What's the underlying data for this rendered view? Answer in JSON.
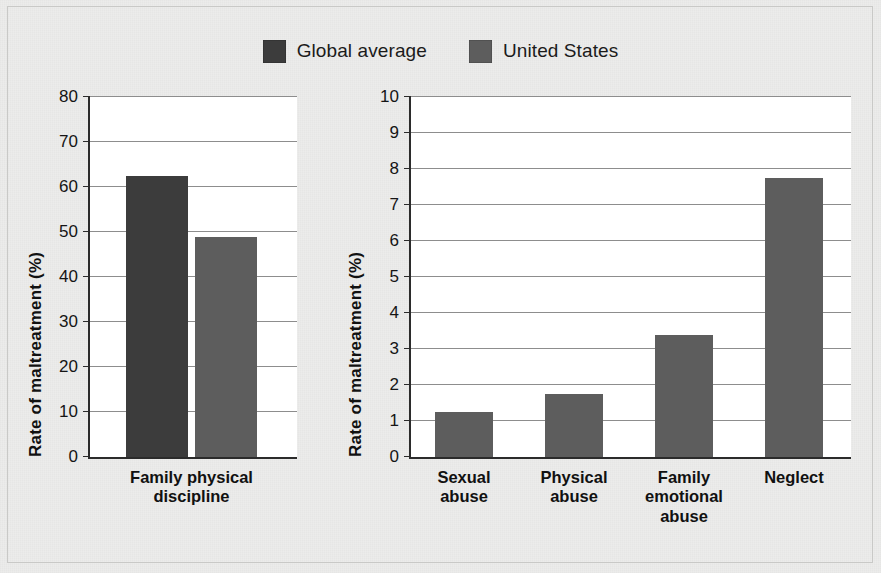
{
  "legend": {
    "items": [
      {
        "label": "Global average",
        "color": "#3c3c3c",
        "icon": "legend-swatch-icon"
      },
      {
        "label": "United States",
        "color": "#5d5d5d",
        "icon": "legend-swatch-icon"
      }
    ]
  },
  "chart_data": [
    {
      "type": "bar",
      "panel": "left",
      "title": "",
      "xlabel": "",
      "ylabel": "Rate of maltreatment (%)",
      "categories": [
        "Family physical\ndiscipline"
      ],
      "ylim": [
        0,
        80
      ],
      "ytick_step": 10,
      "yticks": [
        "0",
        "10",
        "20",
        "30",
        "40",
        "50",
        "60",
        "70",
        "80"
      ],
      "grid": true,
      "legend_position": "top-center",
      "series": [
        {
          "name": "Global average",
          "color": "#3c3c3c",
          "values": [
            62.5
          ]
        },
        {
          "name": "United States",
          "color": "#5d5d5d",
          "values": [
            48.8
          ]
        }
      ]
    },
    {
      "type": "bar",
      "panel": "right",
      "title": "",
      "xlabel": "",
      "ylabel": "Rate of maltreatment (%)",
      "categories": [
        "Sexual\nabuse",
        "Physical\nabuse",
        "Family\nemotional\nabuse",
        "Neglect"
      ],
      "ylim": [
        0,
        10
      ],
      "ytick_step": 1,
      "yticks": [
        "0",
        "1",
        "2",
        "3",
        "4",
        "5",
        "6",
        "7",
        "8",
        "9",
        "10"
      ],
      "grid": true,
      "legend_position": "top-center",
      "series": [
        {
          "name": "United States",
          "color": "#5d5d5d",
          "values": [
            1.25,
            1.75,
            3.4,
            7.75
          ]
        }
      ]
    }
  ]
}
